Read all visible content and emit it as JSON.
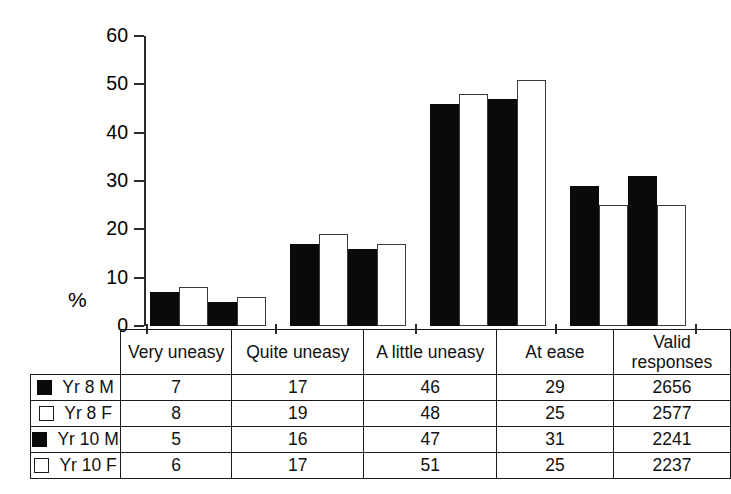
{
  "chart_data": {
    "type": "bar",
    "title": "",
    "xlabel": "",
    "ylabel": "%",
    "ylim": [
      0,
      60
    ],
    "yticks": [
      0,
      10,
      20,
      30,
      40,
      50,
      60
    ],
    "grid": false,
    "legend_position": "table-below",
    "categories": [
      "Very uneasy",
      "Quite uneasy",
      "A little uneasy",
      "At ease"
    ],
    "series": [
      {
        "name": "Yr 8 M",
        "swatch": "solid",
        "values": [
          7,
          17,
          46,
          29
        ],
        "valid_responses": 2656
      },
      {
        "name": "Yr 8 F",
        "swatch": "hollow",
        "values": [
          8,
          19,
          48,
          25
        ],
        "valid_responses": 2577
      },
      {
        "name": "Yr 10 M",
        "swatch": "solid",
        "values": [
          5,
          16,
          47,
          31
        ],
        "valid_responses": 2241
      },
      {
        "name": "Yr 10 F",
        "swatch": "hollow",
        "values": [
          6,
          17,
          51,
          25
        ],
        "valid_responses": 2237
      }
    ]
  },
  "axis": {
    "y_unit_label": "%",
    "ticks": [
      {
        "value": 60,
        "label": "60"
      },
      {
        "value": 50,
        "label": "50"
      },
      {
        "value": 40,
        "label": "40"
      },
      {
        "value": 30,
        "label": "30"
      },
      {
        "value": 20,
        "label": "20"
      },
      {
        "value": 10,
        "label": "10"
      },
      {
        "value": 0,
        "label": "0"
      }
    ]
  },
  "table": {
    "legend_header": "",
    "columns": [
      "Very uneasy",
      "Quite uneasy",
      "A little uneasy",
      "At ease",
      "Valid responses"
    ],
    "rows": [
      {
        "legend": "Yr 8 M",
        "swatch": "solid",
        "cells": [
          "7",
          "17",
          "46",
          "29",
          "2656"
        ]
      },
      {
        "legend": "Yr 8 F",
        "swatch": "hollow",
        "cells": [
          "8",
          "19",
          "48",
          "25",
          "2577"
        ]
      },
      {
        "legend": "Yr 10 M",
        "swatch": "solid",
        "cells": [
          "5",
          "16",
          "47",
          "31",
          "2241"
        ]
      },
      {
        "legend": "Yr 10 F",
        "swatch": "hollow",
        "cells": [
          "6",
          "17",
          "51",
          "25",
          "2237"
        ]
      }
    ]
  },
  "colors": {
    "solid_fill": "#0a0a0a",
    "hollow_fill": "#ffffff",
    "line": "#1a1a1a",
    "background": "#ffffff"
  }
}
